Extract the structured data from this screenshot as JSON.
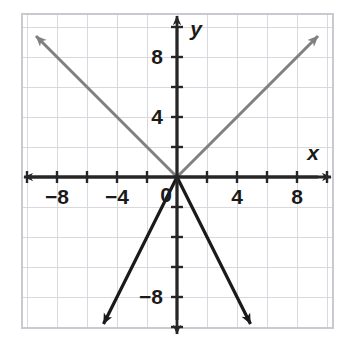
{
  "figure": {
    "name": "coordinate-plane-graph",
    "background_color": "#ffffff",
    "width": 347,
    "height": 351
  },
  "chart_data": {
    "type": "line",
    "title": "",
    "xlabel": "x",
    "ylabel": "y",
    "xlim": [
      -10,
      10
    ],
    "ylim": [
      -10.5,
      10.5
    ],
    "grid": true,
    "grid_color": "#d8d8de",
    "grid_step": 2,
    "axis_color": "#262626",
    "tick_step": 2,
    "legend": "none",
    "x_ticks": [
      -10,
      -8,
      -6,
      -4,
      -2,
      0,
      2,
      4,
      6,
      8,
      10
    ],
    "y_ticks": [
      -10,
      -8,
      -6,
      -4,
      -2,
      0,
      2,
      4,
      6,
      8,
      10
    ],
    "x_tick_labels": [
      {
        "value": -8,
        "text": "−8"
      },
      {
        "value": -4,
        "text": "−4"
      },
      {
        "value": 0,
        "text": "0"
      },
      {
        "value": 4,
        "text": "4"
      },
      {
        "value": 8,
        "text": "8"
      }
    ],
    "y_tick_labels": [
      {
        "value": 8,
        "text": "8"
      },
      {
        "value": 4,
        "text": "4"
      },
      {
        "value": -8,
        "text": "−8"
      }
    ],
    "series": [
      {
        "name": "gray-ray-upper-left",
        "color": "#808080",
        "slope": -1,
        "intercept": 0,
        "from": [
          0,
          0
        ],
        "to": [
          -9.4,
          9.4
        ],
        "arrow": "end"
      },
      {
        "name": "gray-ray-upper-right",
        "color": "#808080",
        "slope": 1,
        "intercept": 0,
        "from": [
          0,
          0
        ],
        "to": [
          9.4,
          9.4
        ],
        "arrow": "end"
      },
      {
        "name": "dark-ray-lower-left",
        "color": "#1a1a1a",
        "slope": 2,
        "intercept": 0,
        "from": [
          0,
          0
        ],
        "to": [
          -4.9,
          -9.8
        ],
        "arrow": "end"
      },
      {
        "name": "dark-ray-lower-right",
        "color": "#1a1a1a",
        "slope": -2,
        "intercept": 0,
        "from": [
          0,
          0
        ],
        "to": [
          4.9,
          -9.8
        ],
        "arrow": "end"
      }
    ],
    "annotations": []
  }
}
